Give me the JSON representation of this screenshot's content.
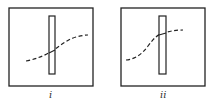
{
  "panels": [
    {
      "label": "i",
      "box": [
        9,
        8,
        84,
        78
      ],
      "bar": [
        49,
        16,
        6,
        58
      ],
      "curve": "M26,61 C36,59 44,56 52,51 C60,46 66,40 76,37 C80,36 84,35 88,35"
    },
    {
      "label": "ii",
      "box": [
        121,
        8,
        84,
        78
      ],
      "bar": [
        159,
        16,
        7,
        58
      ],
      "curve": "M126,60 C136,59 142,54 148,46 C154,38 158,34 164,33 C170,31 176,30 183,30"
    }
  ],
  "colors": {
    "stroke": "#222222"
  }
}
